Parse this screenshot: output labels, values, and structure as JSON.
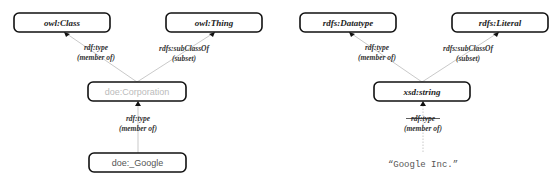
{
  "left_diagram": {
    "nodes": {
      "owl_class": {
        "label": "owl:Class"
      },
      "owl_thing": {
        "label": "owl:Thing"
      },
      "corporation": {
        "label": "doe:Corporation",
        "color": "#bbbbbb"
      },
      "google": {
        "label": "doe:_Google",
        "color": "#555555"
      }
    },
    "edges": {
      "corp_type": {
        "line1": "rdf:type",
        "line2": "(member of)"
      },
      "corp_subclass": {
        "line1": "rdfs:subClassOf",
        "line2": "(subset)"
      },
      "google_type": {
        "line1": "rdf:type",
        "line2": "(member of)"
      }
    }
  },
  "right_diagram": {
    "nodes": {
      "datatype": {
        "label": "rdfs:Datatype"
      },
      "literal_class": {
        "label": "rdfs:Literal"
      },
      "xsd_string": {
        "label": "xsd:string"
      },
      "google_literal": {
        "label": "“Google Inc.”"
      }
    },
    "edges": {
      "string_type": {
        "line1": "rdf:type",
        "line2": "(member of)"
      },
      "string_subclass": {
        "line1": "rdfs:subClassOf",
        "line2": "(subset)"
      },
      "literal_type": {
        "line1": "rdf:type",
        "line2": "(member of)",
        "struck": true
      }
    }
  }
}
